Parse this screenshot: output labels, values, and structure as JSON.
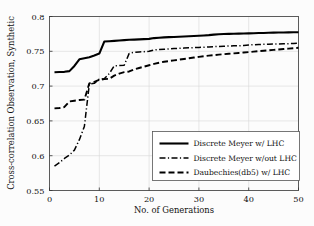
{
  "chart_data": {
    "type": "line",
    "title": "",
    "xlabel": "No. of Generations",
    "ylabel": "Cross-correlation Observation, Synthetic",
    "xlim": [
      0,
      50
    ],
    "ylim": [
      0.55,
      0.8
    ],
    "xticks": [
      "0",
      "10",
      "20",
      "30",
      "40",
      "50"
    ],
    "xtick_values": [
      0,
      10,
      20,
      30,
      40,
      50
    ],
    "yticks": [
      "0.55",
      "0.6",
      "0.65",
      "0.7",
      "0.75",
      "0.8"
    ],
    "ytick_values": [
      0.55,
      0.6,
      0.65,
      0.7,
      0.75,
      0.8
    ],
    "grid": true,
    "legend_position": "lower right",
    "x": [
      1,
      2,
      3,
      4,
      5,
      6,
      7,
      8,
      9,
      10,
      11,
      12,
      13,
      14,
      15,
      16,
      17,
      18,
      19,
      20,
      21,
      22,
      23,
      24,
      25,
      26,
      27,
      28,
      29,
      30,
      31,
      32,
      33,
      34,
      35,
      36,
      37,
      38,
      39,
      40,
      41,
      42,
      43,
      44,
      45,
      46,
      47,
      48,
      49,
      50
    ],
    "series": [
      {
        "name": "Discrete Meyer w/ LHC",
        "style": "solid",
        "color": "#000000",
        "width": 2.1,
        "values": [
          0.72,
          0.7202,
          0.7205,
          0.7215,
          0.729,
          0.7385,
          0.74,
          0.7415,
          0.744,
          0.7468,
          0.764,
          0.7645,
          0.765,
          0.7655,
          0.766,
          0.7665,
          0.7668,
          0.7672,
          0.7675,
          0.7678,
          0.769,
          0.7695,
          0.77,
          0.7703,
          0.7706,
          0.7709,
          0.7712,
          0.7716,
          0.772,
          0.7724,
          0.7728,
          0.7732,
          0.774,
          0.7745,
          0.7748,
          0.775,
          0.7752,
          0.7754,
          0.7756,
          0.7758,
          0.776,
          0.7762,
          0.7764,
          0.7766,
          0.7768,
          0.777,
          0.7771,
          0.7772,
          0.7773,
          0.7774
        ]
      },
      {
        "name": "Discrete Meyer w/out LHC",
        "style": "dashdot",
        "color": "#000000",
        "width": 1.5,
        "values": [
          0.585,
          0.59,
          0.596,
          0.601,
          0.608,
          0.623,
          0.642,
          0.703,
          0.704,
          0.71,
          0.7105,
          0.718,
          0.729,
          0.7295,
          0.73,
          0.747,
          0.7485,
          0.749,
          0.7495,
          0.75,
          0.752,
          0.7525,
          0.753,
          0.7535,
          0.754,
          0.7543,
          0.7546,
          0.755,
          0.7553,
          0.7556,
          0.7558,
          0.7562,
          0.7566,
          0.757,
          0.7573,
          0.7576,
          0.7578,
          0.758,
          0.7582,
          0.759,
          0.7595,
          0.7598,
          0.76,
          0.7602,
          0.7604,
          0.7606,
          0.7608,
          0.761,
          0.7612,
          0.7615
        ]
      },
      {
        "name": "Daubechies(db5) w/ LHC",
        "style": "dashed",
        "color": "#000000",
        "width": 1.9,
        "values": [
          0.668,
          0.6685,
          0.67,
          0.678,
          0.679,
          0.68,
          0.6805,
          0.704,
          0.706,
          0.709,
          0.71,
          0.7105,
          0.715,
          0.718,
          0.72,
          0.721,
          0.724,
          0.726,
          0.728,
          0.73,
          0.732,
          0.7335,
          0.735,
          0.736,
          0.737,
          0.738,
          0.739,
          0.74,
          0.741,
          0.742,
          0.743,
          0.7438,
          0.7445,
          0.7452,
          0.7458,
          0.7464,
          0.747,
          0.7476,
          0.7482,
          0.7488,
          0.7495,
          0.7502,
          0.7508,
          0.7514,
          0.752,
          0.7526,
          0.7532,
          0.7538,
          0.7544,
          0.755
        ]
      }
    ]
  },
  "legend": {
    "entries": [
      {
        "label": "Discrete Meyer w/ LHC"
      },
      {
        "label": "Discrete Meyer w/out LHC"
      },
      {
        "label": "Daubechies(db5) w/ LHC"
      }
    ]
  }
}
